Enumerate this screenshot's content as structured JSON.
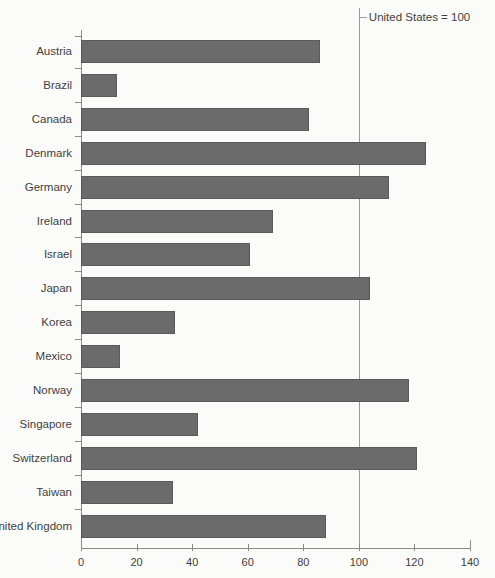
{
  "chart_data": {
    "type": "bar",
    "orientation": "horizontal",
    "title": "",
    "subtitle": "",
    "xlabel": "",
    "ylabel": "",
    "xlim": [
      0,
      140
    ],
    "xticks": [
      0,
      20,
      40,
      60,
      80,
      100,
      120,
      140
    ],
    "xtick_labels": [
      "0",
      "20",
      "40",
      "60",
      "80",
      "100",
      "120",
      "140"
    ],
    "grid": false,
    "legend": false,
    "categories": [
      "Austria",
      "Brazil",
      "Canada",
      "Denmark",
      "Germany",
      "Ireland",
      "Israel",
      "Japan",
      "Korea",
      "Mexico",
      "Norway",
      "Singapore",
      "Switzerland",
      "Taiwan",
      "United Kingdom"
    ],
    "values": [
      86,
      13,
      82,
      124,
      111,
      69,
      61,
      104,
      34,
      14,
      118,
      42,
      121,
      33,
      88
    ],
    "annotations": [
      {
        "text": "United States = 100",
        "value": 100,
        "type": "reference-line"
      }
    ],
    "colors": {
      "bar_fill": "#6b6b6b",
      "bar_border": "#5a5a5a",
      "axis": "#8a8a8a",
      "reference_line": "#9a9a9a",
      "text": "#3f3f3f",
      "background": "#fbfbfa"
    }
  }
}
